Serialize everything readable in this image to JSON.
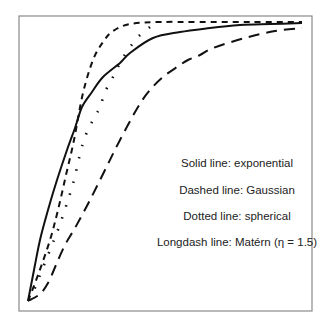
{
  "chart_data": {
    "type": "line",
    "title": "",
    "xlabel": "",
    "ylabel": "",
    "grid": false,
    "axes_ticks": false,
    "legend_position": "inside-right-middle",
    "coordinate_space": "pixels (image coords)",
    "frame": {
      "left": 19,
      "top": 16,
      "right": 312,
      "bottom": 311
    },
    "series": [
      {
        "name": "exponential",
        "style": "solid",
        "points": [
          [
            28,
            301
          ],
          [
            34,
            270
          ],
          [
            40,
            240
          ],
          [
            48,
            210
          ],
          [
            57,
            180
          ],
          [
            67,
            150
          ],
          [
            75,
            128
          ],
          [
            82,
            107
          ],
          [
            92,
            92
          ],
          [
            103,
            77
          ],
          [
            120,
            63
          ],
          [
            130,
            53
          ],
          [
            153,
            38
          ],
          [
            180,
            32
          ],
          [
            210,
            28
          ],
          [
            240,
            25
          ],
          [
            270,
            24
          ],
          [
            302,
            23
          ]
        ]
      },
      {
        "name": "Gaussian",
        "style": "dashed",
        "points": [
          [
            28,
            301
          ],
          [
            38,
            275
          ],
          [
            50,
            240
          ],
          [
            58,
            210
          ],
          [
            66,
            175
          ],
          [
            74,
            140
          ],
          [
            83,
            93
          ],
          [
            93,
            60
          ],
          [
            103,
            42
          ],
          [
            113,
            31
          ],
          [
            130,
            24
          ],
          [
            160,
            22
          ],
          [
            200,
            22
          ],
          [
            250,
            22
          ],
          [
            302,
            22
          ]
        ]
      },
      {
        "name": "spherical",
        "style": "dotted",
        "points": [
          [
            30,
            300
          ],
          [
            36,
            285
          ],
          [
            44,
            265
          ],
          [
            52,
            245
          ],
          [
            59,
            227
          ],
          [
            68,
            200
          ],
          [
            74,
            180
          ],
          [
            81,
            150
          ],
          [
            87,
            132
          ],
          [
            94,
            118
          ],
          [
            100,
            107
          ],
          [
            105,
            92
          ],
          [
            113,
            77
          ],
          [
            120,
            63
          ],
          [
            128,
            50
          ],
          [
            138,
            37
          ],
          [
            150,
            27
          ]
        ]
      },
      {
        "name": "Matérn (η = 1.5)",
        "style": "longdash",
        "points": [
          [
            28,
            301
          ],
          [
            40,
            294
          ],
          [
            48,
            283
          ],
          [
            56,
            265
          ],
          [
            65,
            245
          ],
          [
            75,
            228
          ],
          [
            90,
            200
          ],
          [
            105,
            170
          ],
          [
            120,
            140
          ],
          [
            138,
            107
          ],
          [
            150,
            90
          ],
          [
            163,
            77
          ],
          [
            177,
            67
          ],
          [
            188,
            60
          ],
          [
            200,
            55
          ],
          [
            213,
            48
          ],
          [
            245,
            38
          ],
          [
            275,
            31
          ],
          [
            302,
            28
          ]
        ]
      }
    ],
    "annotations": [
      "Solid line: exponential",
      "Dashed line: Gaussian",
      "Dotted line: spherical",
      "Longdash line: Matérn (η = 1.5)"
    ]
  },
  "legend": {
    "lines": [
      {
        "text": "Solid line: exponential",
        "x": 237,
        "y": 167
      },
      {
        "text": "Dashed line: Gaussian",
        "x": 237,
        "y": 194
      },
      {
        "text": "Dotted line: spherical",
        "x": 237,
        "y": 220
      },
      {
        "text": "Longdash line: Matérn (η = 1.5)",
        "x": 237,
        "y": 246
      }
    ]
  },
  "cutoff_caption": "· · · · · · · · · · · ·"
}
